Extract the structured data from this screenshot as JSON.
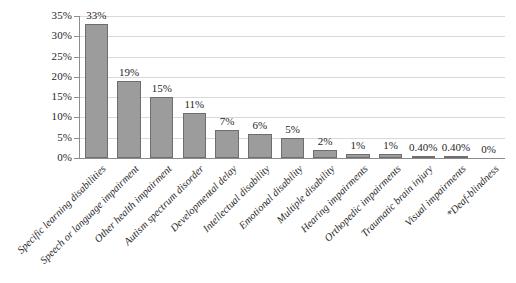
{
  "chart_data": {
    "type": "bar",
    "title": "",
    "subtitle": "",
    "xlabel": "",
    "ylabel": "",
    "ylim": [
      0,
      35
    ],
    "ytick_labels": [
      "0%",
      "5%",
      "10%",
      "15%",
      "20%",
      "25%",
      "30%",
      "35%"
    ],
    "ytick_values": [
      0,
      5,
      10,
      15,
      20,
      25,
      30,
      35
    ],
    "grid": true,
    "legend": false,
    "legend_position": "none",
    "bar_color": "#9c9c9c",
    "bar_border_color": "#6e6e6e",
    "gridline_color": "#d9d9d9",
    "axis_color": "#8c8c8c",
    "categories": [
      "Specific learning disabilities",
      "Speech or language impairment",
      "Other health impairment",
      "Autism spectrum disorder",
      "Developmental delay",
      "Intellectual disability",
      "Emotional disability",
      "Multiple disability",
      "Hearing impairments",
      "Orthopedic impairments",
      "Traumatic brain injury",
      "Visual impairments",
      "*Deaf-blindness"
    ],
    "values": [
      33,
      19,
      15,
      11,
      7,
      6,
      5,
      2,
      1,
      1,
      0.4,
      0.4,
      0
    ],
    "data_labels": [
      "33%",
      "19%",
      "15%",
      "11%",
      "7%",
      "6%",
      "5%",
      "2%",
      "1%",
      "1%",
      "0.40%",
      "0.40%",
      "0%"
    ]
  }
}
